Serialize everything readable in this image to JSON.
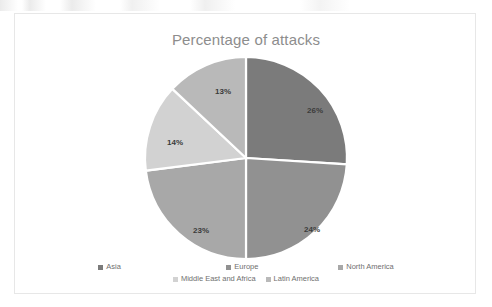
{
  "chart_data": {
    "type": "pie",
    "title": "Percentage of attacks",
    "categories": [
      "Asia",
      "Europe",
      "North America",
      "Middle East and Africa",
      "Latin America"
    ],
    "values": [
      26,
      24,
      23,
      14,
      13
    ],
    "value_labels": [
      "26%",
      "24%",
      "23%",
      "14%",
      "13%"
    ],
    "colors": [
      "#7b7b7b",
      "#919191",
      "#a8a8a8",
      "#d2d2d2",
      "#b9b9b9"
    ],
    "separator_color": "#ffffff",
    "start_angle_deg": 0,
    "direction": "clockwise",
    "legend_position": "bottom",
    "grid": false,
    "xlabel": "",
    "ylabel": ""
  },
  "chart": {
    "title": "Percentage of attacks",
    "title_color": "#8d8d8d",
    "border_color": "#e7e7e7",
    "background": "#ffffff"
  },
  "legend": {
    "row1": [
      {
        "label": "Asia",
        "color": "#7b7b7b"
      },
      {
        "label": "Europe",
        "color": "#919191"
      },
      {
        "label": "North America",
        "color": "#a8a8a8"
      }
    ],
    "row2": [
      {
        "label": "Middle East and Africa",
        "color": "#d2d2d2"
      },
      {
        "label": "Latin America",
        "color": "#b9b9b9"
      }
    ]
  },
  "slice_labels": [
    {
      "text": "26%",
      "x": 300,
      "y": 96
    },
    {
      "text": "24%",
      "x": 297,
      "y": 215
    },
    {
      "text": "23%",
      "x": 186,
      "y": 216
    },
    {
      "text": "14%",
      "x": 160,
      "y": 128
    },
    {
      "text": "13%",
      "x": 208,
      "y": 77
    }
  ]
}
